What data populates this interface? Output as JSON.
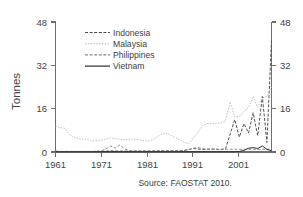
{
  "chart_data": {
    "type": "line",
    "title": "",
    "xlabel": "",
    "ylabel": "Tonnes",
    "ylim": [
      0,
      48
    ],
    "xlim": [
      1961,
      2008
    ],
    "yticks": [
      0,
      16,
      32,
      48
    ],
    "ytick_labels": [
      "0",
      "16",
      "32",
      "48"
    ],
    "yticks_right": [
      0,
      16,
      32,
      48
    ],
    "ytick_labels_right": [
      "0",
      "16",
      "32",
      "48"
    ],
    "xticks": [
      1961,
      1971,
      1981,
      1991,
      2001
    ],
    "xtick_labels": [
      "1961",
      "1971",
      "1981",
      "1991",
      "2001"
    ],
    "grid": false,
    "legend_position": "upper-center",
    "dual_y_axis": true,
    "source_note": "Source: FAOSTAT 2010.",
    "x": [
      1961,
      1962,
      1963,
      1964,
      1965,
      1966,
      1967,
      1968,
      1969,
      1970,
      1971,
      1972,
      1973,
      1974,
      1975,
      1976,
      1977,
      1978,
      1979,
      1980,
      1981,
      1982,
      1983,
      1984,
      1985,
      1986,
      1987,
      1988,
      1989,
      1990,
      1991,
      1992,
      1993,
      1994,
      1995,
      1996,
      1997,
      1998,
      1999,
      2000,
      2001,
      2002,
      2003,
      2004,
      2005,
      2006,
      2007,
      2008
    ],
    "series": [
      {
        "name": "Indonesia",
        "color": "#4a4a4a",
        "style": "dashed",
        "values": [
          0.3,
          0.2,
          0.2,
          0.2,
          0.2,
          0.2,
          0.2,
          0.2,
          0.2,
          0.2,
          0.2,
          0.3,
          0.4,
          0.4,
          0.3,
          0.3,
          0.3,
          0.3,
          0.3,
          0.3,
          0.3,
          0.3,
          0.4,
          0.4,
          0.4,
          0.4,
          0.4,
          0.5,
          0.6,
          0.9,
          1.3,
          1.1,
          0.9,
          1.0,
          1.1,
          1.0,
          0.9,
          1.2,
          6.5,
          12.0,
          5.5,
          10.5,
          7.0,
          14.5,
          6.0,
          20.5,
          3.5,
          41.0
        ]
      },
      {
        "name": "Malaysia",
        "color": "#b9b9b9",
        "style": "dotted",
        "values": [
          9.5,
          9.0,
          8.8,
          6.5,
          5.5,
          5.0,
          4.8,
          4.6,
          4.0,
          4.2,
          4.4,
          4.8,
          5.2,
          5.0,
          4.6,
          4.5,
          4.7,
          4.8,
          4.6,
          4.2,
          4.0,
          4.4,
          5.5,
          6.5,
          7.0,
          6.2,
          5.4,
          4.6,
          3.6,
          3.0,
          5.0,
          7.5,
          9.8,
          10.5,
          10.5,
          10.6,
          10.8,
          11.5,
          18.5,
          13.0,
          13.0,
          15.0,
          16.5,
          20.5,
          16.5,
          20.0,
          20.5,
          24.0
        ]
      },
      {
        "name": "Philippines",
        "color": "#8a8a8a",
        "style": "dashed",
        "values": [
          0.2,
          0.2,
          0.2,
          0.2,
          0.2,
          0.2,
          0.2,
          0.2,
          0.2,
          0.3,
          0.4,
          1.2,
          2.2,
          1.4,
          2.6,
          1.2,
          0.5,
          0.4,
          0.4,
          0.4,
          0.4,
          0.4,
          0.4,
          0.4,
          0.4,
          0.4,
          0.4,
          0.5,
          0.6,
          0.8,
          1.4,
          1.7,
          1.2,
          1.0,
          1.0,
          1.0,
          1.0,
          1.0,
          1.0,
          1.0,
          1.0,
          1.0,
          1.0,
          1.0,
          1.0,
          1.0,
          1.0,
          1.2
        ]
      },
      {
        "name": "Vietnam",
        "color": "#2f2f2f",
        "style": "solid",
        "values": [
          0.1,
          0.1,
          0.1,
          0.1,
          0.1,
          0.1,
          0.1,
          0.1,
          0.1,
          0.1,
          0.1,
          0.1,
          0.1,
          0.1,
          0.1,
          0.1,
          0.1,
          0.1,
          0.1,
          0.1,
          0.1,
          0.1,
          0.1,
          0.1,
          0.1,
          0.1,
          0.1,
          0.1,
          0.1,
          0.1,
          0.1,
          0.1,
          0.1,
          0.1,
          0.1,
          0.1,
          0.1,
          0.1,
          0.1,
          0.1,
          0.2,
          0.6,
          1.4,
          1.6,
          1.3,
          2.2,
          1.0,
          0.4
        ]
      }
    ],
    "legend": [
      {
        "label": "Indonesia"
      },
      {
        "label": "Malaysia"
      },
      {
        "label": "Philippines"
      },
      {
        "label": "Vietnam"
      }
    ]
  }
}
